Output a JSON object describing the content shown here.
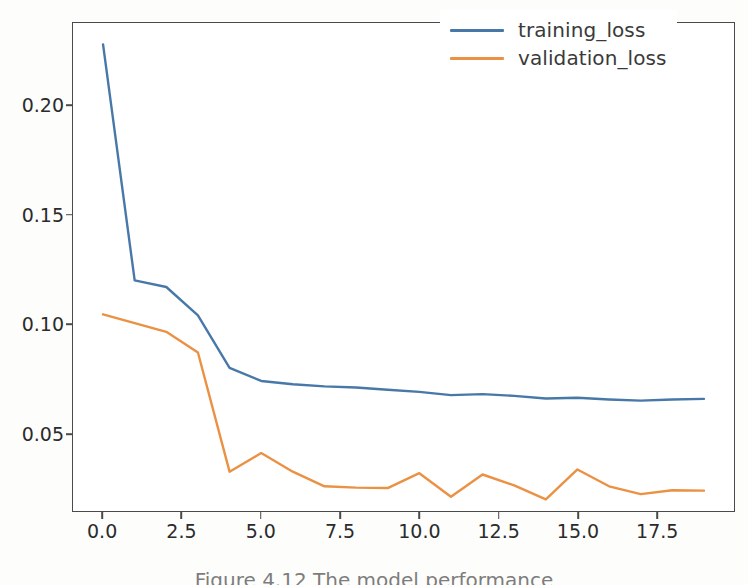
{
  "chart_data": {
    "type": "line",
    "title": "",
    "xlabel": "",
    "ylabel": "",
    "x": [
      0,
      1,
      2,
      3,
      4,
      5,
      6,
      7,
      8,
      9,
      10,
      11,
      12,
      13,
      14,
      15,
      16,
      17,
      18,
      19
    ],
    "series": [
      {
        "name": "training_loss",
        "color": "#4878a8",
        "values": [
          0.228,
          0.12,
          0.117,
          0.104,
          0.08,
          0.074,
          0.0725,
          0.0715,
          0.071,
          0.07,
          0.069,
          0.0675,
          0.068,
          0.0672,
          0.066,
          0.0663,
          0.0655,
          0.065,
          0.0655,
          0.0658
        ]
      },
      {
        "name": "validation_loss",
        "color": "#eb9143",
        "values": [
          0.1045,
          0.1005,
          0.0965,
          0.087,
          0.0325,
          0.041,
          0.0325,
          0.0258,
          0.0252,
          0.025,
          0.0318,
          0.021,
          0.0312,
          0.0262,
          0.0198,
          0.0335,
          0.0258,
          0.0222,
          0.024,
          0.0238
        ]
      }
    ],
    "xticks": [
      0.0,
      2.5,
      5.0,
      7.5,
      10.0,
      12.5,
      15.0,
      17.5
    ],
    "xtick_labels": [
      "0.0",
      "2.5",
      "5.0",
      "7.5",
      "10.0",
      "12.5",
      "15.0",
      "17.5"
    ],
    "yticks": [
      0.05,
      0.1,
      0.15,
      0.2
    ],
    "ytick_labels": [
      "0.05",
      "0.10",
      "0.15",
      "0.20"
    ],
    "xlim": [
      -0.95,
      19.95
    ],
    "ylim": [
      0.0145,
      0.2378
    ],
    "grid": false,
    "legend_position": "upper right",
    "legend_entries": [
      "training_loss",
      "validation_loss"
    ]
  },
  "legend": {
    "entries": [
      {
        "label": "training_loss",
        "color": "#4878a8"
      },
      {
        "label": "validation_loss",
        "color": "#eb9143"
      }
    ]
  },
  "caption": {
    "text": "Figure 4.12   The model performance"
  },
  "colors": {
    "training": "#4878a8",
    "validation": "#eb9143",
    "axis": "#4a4a4a",
    "tick_text": "#2b2b2b",
    "background": "#fdfdfc"
  }
}
